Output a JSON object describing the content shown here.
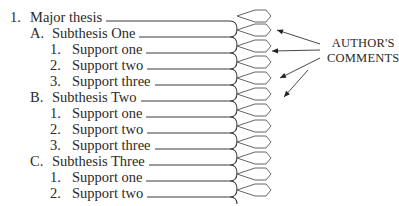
{
  "outline": {
    "rows": [
      {
        "marker": "1.",
        "text": "Major thesis",
        "level": 0
      },
      {
        "marker": "A.",
        "text": "Subthesis One",
        "level": 1
      },
      {
        "marker": "1.",
        "text": "Support one",
        "level": 2
      },
      {
        "marker": "2.",
        "text": "Support two",
        "level": 2
      },
      {
        "marker": "3.",
        "text": "Support three",
        "level": 2
      },
      {
        "marker": "B.",
        "text": "Subthesis Two",
        "level": 1
      },
      {
        "marker": "1.",
        "text": "Support one",
        "level": 2
      },
      {
        "marker": "2.",
        "text": "Support two",
        "level": 2
      },
      {
        "marker": "3.",
        "text": "Support three",
        "level": 2
      },
      {
        "marker": "C.",
        "text": "Subthesis Three",
        "level": 1
      },
      {
        "marker": "1.",
        "text": "Support one",
        "level": 2
      },
      {
        "marker": "2.",
        "text": "Support two",
        "level": 2
      }
    ]
  },
  "annotation": {
    "line1": "AUTHOR'S",
    "line2": "COMMENTS"
  },
  "colors": {
    "text": "#2a2a2a",
    "lines": "#3a3a3a",
    "diamonds": "#555555"
  }
}
